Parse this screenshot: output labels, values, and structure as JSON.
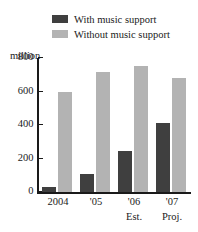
{
  "legend": {
    "position": "top",
    "entries": [
      {
        "label": "With music support",
        "color": "#3f3f3f",
        "key": "with_music_support"
      },
      {
        "label": "Without music support",
        "color": "#b3b3b3",
        "key": "without_music_support"
      }
    ]
  },
  "axis": {
    "unit_label": "million",
    "y_ticks": [
      "800",
      "600",
      "400",
      "200",
      "0"
    ],
    "y_tick_values": [
      800,
      600,
      400,
      200,
      0
    ]
  },
  "categories": [
    {
      "line1": "2004",
      "line2": ""
    },
    {
      "line1": "'05",
      "line2": ""
    },
    {
      "line1": "'06",
      "line2": "Est."
    },
    {
      "line1": "'07",
      "line2": "Proj."
    }
  ],
  "chart_data": {
    "type": "bar",
    "title": "",
    "subtitle": "",
    "xlabel": "",
    "ylabel": "million",
    "ylim": [
      0,
      800
    ],
    "grid": false,
    "legend_position": "top",
    "categories": [
      "2004",
      "'05",
      "'06 Est.",
      "'07 Proj."
    ],
    "series": [
      {
        "name": "With music support",
        "color": "#3f3f3f",
        "values": [
          30,
          105,
          245,
          415
        ]
      },
      {
        "name": "Without music support",
        "color": "#b3b3b3",
        "values": [
          600,
          715,
          750,
          680
        ]
      }
    ],
    "annotations": [
      "'06 labelled Est.",
      "'07 labelled Proj."
    ]
  },
  "colors": {
    "dark": "#3f3f3f",
    "light": "#b3b3b3",
    "axis": "#1a1a1a",
    "background": "#ffffff"
  }
}
